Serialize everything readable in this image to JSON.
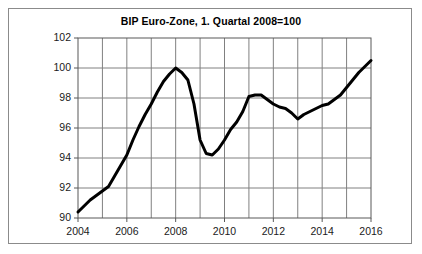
{
  "figure": {
    "title": "BIP Euro-Zone, 1. Quartal 2008=100",
    "border_color": "#8b8b8b",
    "background_color": "#ffffff"
  },
  "chart_data": {
    "type": "line",
    "title": "BIP Euro-Zone, 1. Quartal 2008=100",
    "xlabel": "",
    "ylabel": "",
    "xlim": [
      2004,
      2016
    ],
    "ylim": [
      90,
      102
    ],
    "grid": true,
    "legend": false,
    "line_color": "#000000",
    "line_width": 3,
    "y_ticks": [
      90,
      92,
      94,
      96,
      98,
      100,
      102
    ],
    "y_tick_labels": [
      "90",
      "92",
      "94",
      "96",
      "98",
      "100",
      "102"
    ],
    "x_ticks": [
      2004,
      2006,
      2008,
      2010,
      2012,
      2014,
      2016
    ],
    "x_tick_labels": [
      "2004",
      "2006",
      "2008",
      "2010",
      "2012",
      "2014",
      "2016"
    ],
    "x_gridlines": [
      2004,
      2005,
      2006,
      2007,
      2008,
      2009,
      2010,
      2011,
      2012,
      2013,
      2014,
      2015,
      2016
    ],
    "series": [
      {
        "name": "BIP Euro-Zone",
        "x": [
          2004.0,
          2004.25,
          2004.5,
          2004.75,
          2005.0,
          2005.25,
          2005.5,
          2005.75,
          2006.0,
          2006.25,
          2006.5,
          2006.75,
          2007.0,
          2007.25,
          2007.5,
          2007.75,
          2008.0,
          2008.25,
          2008.5,
          2008.75,
          2009.0,
          2009.25,
          2009.5,
          2009.75,
          2010.0,
          2010.25,
          2010.5,
          2010.75,
          2011.0,
          2011.25,
          2011.5,
          2011.75,
          2012.0,
          2012.25,
          2012.5,
          2012.75,
          2013.0,
          2013.25,
          2013.5,
          2013.75,
          2014.0,
          2014.25,
          2014.5,
          2014.75,
          2015.0,
          2015.25,
          2015.5,
          2015.75,
          2016.0
        ],
        "y": [
          90.4,
          90.8,
          91.2,
          91.5,
          91.8,
          92.1,
          92.8,
          93.5,
          94.2,
          95.2,
          96.1,
          96.9,
          97.6,
          98.4,
          99.1,
          99.6,
          100.0,
          99.7,
          99.2,
          97.6,
          95.2,
          94.3,
          94.2,
          94.6,
          95.2,
          95.9,
          96.4,
          97.1,
          98.1,
          98.2,
          98.2,
          97.9,
          97.6,
          97.4,
          97.3,
          97.0,
          96.6,
          96.9,
          97.1,
          97.3,
          97.5,
          97.6,
          97.9,
          98.2,
          98.7,
          99.2,
          99.7,
          100.1,
          100.5
        ]
      }
    ],
    "annotations": {
      "peak": {
        "x": 2008.0,
        "y": 100.0,
        "label": "Peak 1. Quartal 2008 = 100"
      },
      "trough": {
        "x": 2009.5,
        "y": 94.2,
        "label": "Tiefpunkt 2009"
      },
      "secondary_trough": {
        "x": 2013.0,
        "y": 96.6,
        "label": "Zweiter Tiefpunkt 2013"
      },
      "end": {
        "x": 2016.0,
        "y": 100.5,
        "label": "Ende 2016"
      }
    }
  }
}
